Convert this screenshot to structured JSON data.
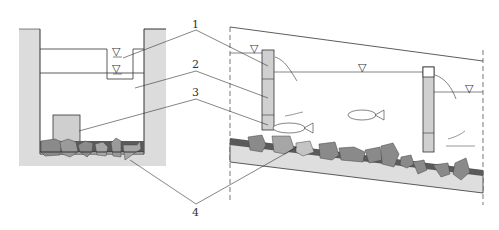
{
  "diagram": {
    "labels": [
      {
        "id": "1",
        "text": "1"
      },
      {
        "id": "2",
        "text": "2"
      },
      {
        "id": "3",
        "text": "3"
      },
      {
        "id": "4",
        "text": "4"
      }
    ],
    "water_level_symbol": "▽",
    "colors": {
      "wall": "#d9d9d9",
      "line": "#333333",
      "rock_dark": "#8a8a8a",
      "rock_mid": "#a6a6a6",
      "rock_light": "#c4c4c4",
      "base_dark": "#5a5a5a",
      "block": "#cfcfcf"
    }
  }
}
